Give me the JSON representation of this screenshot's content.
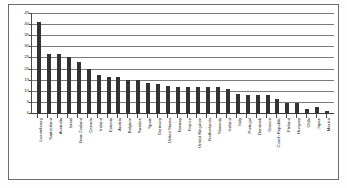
{
  "chart_data": {
    "type": "bar",
    "title": "",
    "subtitle": "",
    "xlabel": "",
    "ylabel": "",
    "ylim": [
      0,
      45
    ],
    "ytick_step": 5,
    "yticks": [
      0,
      5,
      10,
      15,
      20,
      25,
      30,
      35,
      40,
      45
    ],
    "ytick_labels": [
      "0",
      "5",
      "10",
      "15",
      "20",
      "25",
      "30",
      "35",
      "40",
      "45"
    ],
    "grid": true,
    "legend": false,
    "legend_position": "none",
    "bar_color": "#333333",
    "categories": [
      "Luxembourg",
      "Switzerland",
      "Australia",
      "Israel",
      "New Zealand",
      "Canada",
      "Ireland",
      "Estonia",
      "Austria",
      "Belgium",
      "Sweden",
      "Spain",
      "Germany",
      "United States",
      "Norway",
      "France",
      "United Kingdom",
      "Netherlands",
      "Slovenia",
      "Iceland",
      "Italy",
      "Portugal",
      "Denmark",
      "Greece",
      "Czech Republic",
      "Finland",
      "Hungary",
      "Chile",
      "Japan",
      "Mexico"
    ],
    "values": [
      41,
      26.5,
      26.5,
      25,
      23,
      20,
      17,
      16,
      16,
      15,
      15,
      13.5,
      13,
      12,
      11.5,
      11.5,
      11.5,
      11.5,
      11.5,
      11,
      8.5,
      8,
      8,
      8,
      6.5,
      4.5,
      4.5,
      2,
      2.5,
      1
    ]
  },
  "colors": {
    "bar": "#333333",
    "gridline": "#7a7a7a",
    "axis": "#4a4a4a",
    "frame": "#6b6b6b",
    "text": "#1a1a1a",
    "background": "#ffffff"
  }
}
